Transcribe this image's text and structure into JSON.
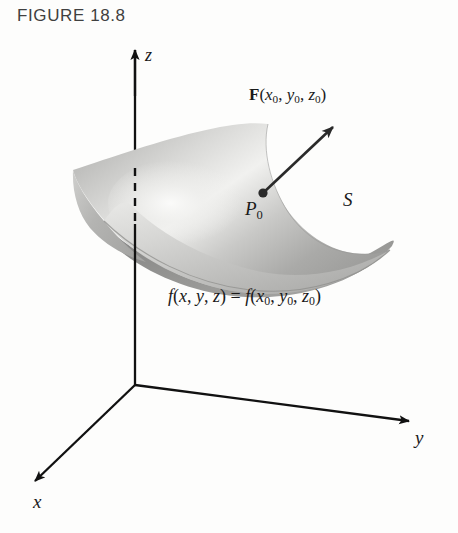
{
  "figure": {
    "title": "FIGURE 18.8",
    "background_color": "#fdfdfc",
    "ink_color": "#1a1a1a",
    "title_color": "#404040"
  },
  "axes": {
    "z": {
      "label": "z",
      "dashed_note": "hidden behind surface"
    },
    "y": {
      "label": "y"
    },
    "x": {
      "label": "x"
    },
    "origin": {
      "x": 135,
      "y": 385
    }
  },
  "labels": {
    "vector_field": {
      "symbol": "F",
      "open": "(",
      "var1": "x",
      "sub1": "0",
      "sep1": ", ",
      "var2": "y",
      "sub2": "0",
      "sep2": ", ",
      "var3": "z",
      "sub3": "0",
      "close": ")"
    },
    "point": {
      "symbol": "P",
      "subscript": "0"
    },
    "surface": {
      "symbol": "S"
    },
    "level_surface_equation": {
      "lhs_f": "f",
      "lhs_open": "(",
      "lhs_x": "x",
      "lhs_sep1": ", ",
      "lhs_y": "y",
      "lhs_sep2": ", ",
      "lhs_z": "z",
      "lhs_close": ")",
      "equals": " = ",
      "rhs_f": "f",
      "rhs_open": "(",
      "rhs_x": "x",
      "rhs_x_sub": "0",
      "rhs_sep1": ", ",
      "rhs_y": "y",
      "rhs_y_sub": "0",
      "rhs_sep2": ", ",
      "rhs_z": "z",
      "rhs_z_sub": "0",
      "rhs_close": ")"
    }
  },
  "colors": {
    "surface_light": "#f2f2f0",
    "surface_mid": "#b6b6b4",
    "surface_dark": "#8f8f8d",
    "surface_underside": "#8a8a88",
    "surface_edge": "#6e6e6c",
    "axis": "#111111",
    "arrow": "#2a2a2a"
  },
  "geometry": {
    "surface_type": "saddle (hyperbolic paraboloid)",
    "vector_arrow": {
      "tail_x": 263,
      "tail_y": 193,
      "head_x": 339,
      "head_y": 121
    },
    "z_axis_tip": {
      "x": 135,
      "y": 47
    },
    "y_axis_tip": {
      "x": 416,
      "y": 423
    },
    "x_axis_tip": {
      "x": 27,
      "y": 487
    }
  }
}
